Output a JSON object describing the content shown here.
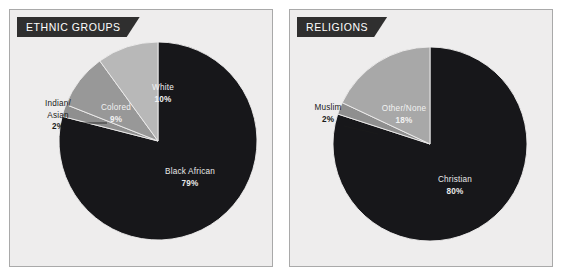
{
  "figure": {
    "background_color": "#ffffff",
    "panel_background": "#eeeded",
    "panel_border": "#a9a9a9",
    "banner_background": "#2f2f2f",
    "banner_text_color": "#ffffff"
  },
  "panels": [
    {
      "id": "ethnic-groups",
      "banner_label": "ETHNIC GROUPS"
    },
    {
      "id": "religions",
      "banner_label": "RELIGIONS"
    }
  ],
  "chart_data": [
    {
      "type": "pie",
      "title": "ETHNIC GROUPS",
      "xlabel": "",
      "ylabel": "",
      "legend_position": "none",
      "grid": false,
      "start_angle_deg": 0,
      "direction": "clockwise",
      "categories": [
        "Black African",
        "Indian/Asian",
        "Colored",
        "White"
      ],
      "values": [
        79,
        2,
        9,
        10
      ],
      "value_labels": [
        "79%",
        "2%",
        "9%",
        "10%"
      ],
      "colors": [
        "#17171a",
        "#8f8f8f",
        "#989898",
        "#b8b8b8"
      ],
      "slices": [
        {
          "name": "Black African",
          "value": 79,
          "value_label": "79%",
          "color": "#17171a",
          "label_placement": "inside",
          "label_line1": "Black African",
          "label_line2": "79%"
        },
        {
          "name": "Indian/Asian",
          "value": 2,
          "value_label": "2%",
          "color": "#8f8f8f",
          "label_placement": "outside-leader",
          "label_line1": "Indian/",
          "label_line2": "Asian",
          "label_line3": "2%"
        },
        {
          "name": "Colored",
          "value": 9,
          "value_label": "9%",
          "color": "#989898",
          "label_placement": "inside",
          "label_line1": "Colored",
          "label_line2": "9%"
        },
        {
          "name": "White",
          "value": 10,
          "value_label": "10%",
          "color": "#b8b8b8",
          "label_placement": "inside",
          "label_line1": "White",
          "label_line2": "10%"
        }
      ]
    },
    {
      "type": "pie",
      "title": "RELIGIONS",
      "xlabel": "",
      "ylabel": "",
      "legend_position": "none",
      "grid": false,
      "start_angle_deg": 0,
      "direction": "clockwise",
      "categories": [
        "Christian",
        "Muslim",
        "Other/None"
      ],
      "values": [
        80,
        2,
        18
      ],
      "value_labels": [
        "80%",
        "2%",
        "18%"
      ],
      "colors": [
        "#17171a",
        "#8f8f8f",
        "#a8a8a8"
      ],
      "slices": [
        {
          "name": "Christian",
          "value": 80,
          "value_label": "80%",
          "color": "#17171a",
          "label_placement": "inside",
          "label_line1": "Christian",
          "label_line2": "80%"
        },
        {
          "name": "Muslim",
          "value": 2,
          "value_label": "2%",
          "color": "#8f8f8f",
          "label_placement": "outside-leader",
          "label_line1": "Muslim",
          "label_line2": "2%"
        },
        {
          "name": "Other/None",
          "value": 18,
          "value_label": "18%",
          "color": "#a8a8a8",
          "label_placement": "inside",
          "label_line1": "Other/None",
          "label_line2": "18%"
        }
      ]
    }
  ]
}
